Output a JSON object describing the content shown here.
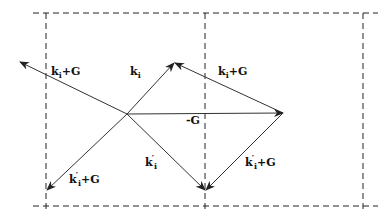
{
  "diagram": {
    "type": "vector-diagram",
    "colors": {
      "lines": "#333333",
      "dashed": "#222222",
      "background": "#ffffff"
    },
    "origin": {
      "x": 127,
      "y": 114
    },
    "labels": {
      "ki_plus_G_left": {
        "k": "k",
        "sub": "i",
        "suffix": "+G"
      },
      "ki": {
        "k": "k",
        "sub": "i"
      },
      "ki_plus_G_right": {
        "k": "k",
        "sub": "i",
        "suffix": "+G"
      },
      "minus_G": {
        "text": "-G"
      },
      "kpi": {
        "k": "k",
        "prime": "′",
        "sub": "i"
      },
      "kpi_plus_G_left": {
        "k": "k",
        "prime": "′",
        "sub": "i",
        "suffix": "+G"
      },
      "kpi_plus_G_right": {
        "k": "k",
        "prime": "′",
        "sub": "i",
        "suffix": "+G"
      }
    },
    "vectors": [
      {
        "name": "k_i",
        "from": [
          127,
          114
        ],
        "to": [
          174,
          63
        ]
      },
      {
        "name": "k_i+G (left)",
        "from": [
          127,
          114
        ],
        "to": [
          20,
          62
        ]
      },
      {
        "name": "k_i+G (right)",
        "from": [
          283,
          113
        ],
        "to": [
          174,
          63
        ]
      },
      {
        "name": "-G",
        "from": [
          127,
          114
        ],
        "to": [
          283,
          113
        ]
      },
      {
        "name": "k'_i",
        "from": [
          127,
          114
        ],
        "to": [
          205,
          190
        ]
      },
      {
        "name": "k'_i+G (left)",
        "from": [
          127,
          114
        ],
        "to": [
          46,
          190
        ]
      },
      {
        "name": "k'_i+G (right)",
        "from": [
          283,
          113
        ],
        "to": [
          205,
          190
        ]
      }
    ],
    "grid": {
      "top_y": 13,
      "bottom_y": 206,
      "left_x": 33,
      "right_x": 378,
      "verticals_x": [
        46,
        205,
        363
      ]
    }
  }
}
